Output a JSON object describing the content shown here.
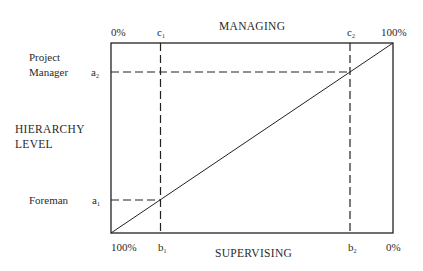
{
  "diagram": {
    "top_axis_title": "MANAGING",
    "bottom_axis_title": "SUPERVISING",
    "left_axis_title_line1": "HIERARCHY",
    "left_axis_title_line2": "LEVEL",
    "top_left_pct": "0%",
    "top_right_pct": "100%",
    "bottom_left_pct": "100%",
    "bottom_right_pct": "0%",
    "markers": {
      "c1": {
        "base": "c",
        "sub": "1"
      },
      "c2": {
        "base": "c",
        "sub": "2"
      },
      "b1": {
        "base": "b",
        "sub": "1"
      },
      "b2": {
        "base": "b",
        "sub": "2"
      },
      "a1": {
        "base": "a",
        "sub": "1"
      },
      "a2": {
        "base": "a",
        "sub": "2"
      }
    },
    "level_labels": {
      "project_manager_line1": "Project",
      "project_manager_line2": "Manager",
      "foreman": "Foreman"
    },
    "line_color": "#222222"
  }
}
